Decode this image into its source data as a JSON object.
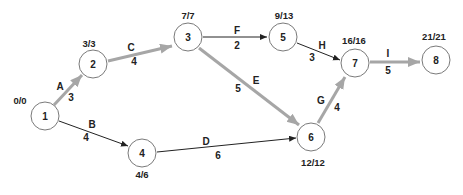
{
  "diagram": {
    "type": "activity-on-arrow network (critical path)",
    "nodes": [
      {
        "id": "1",
        "label": "1",
        "times": "0/0",
        "x": 45,
        "y": 116
      },
      {
        "id": "2",
        "label": "2",
        "times": "3/3",
        "x": 93,
        "y": 64
      },
      {
        "id": "3",
        "label": "3",
        "times": "7/7",
        "x": 188,
        "y": 37
      },
      {
        "id": "4",
        "label": "4",
        "times": "4/6",
        "x": 142,
        "y": 153
      },
      {
        "id": "5",
        "label": "5",
        "times": "9/13",
        "x": 283,
        "y": 37
      },
      {
        "id": "6",
        "label": "6",
        "times": "12/12",
        "x": 311,
        "y": 137
      },
      {
        "id": "7",
        "label": "7",
        "times": "16/16",
        "x": 355,
        "y": 63
      },
      {
        "id": "8",
        "label": "8",
        "times": "21/21",
        "x": 436,
        "y": 60
      }
    ],
    "edges": [
      {
        "activity": "A",
        "duration": "3",
        "from": "1",
        "to": "2",
        "critical": true
      },
      {
        "activity": "B",
        "duration": "4",
        "from": "1",
        "to": "4",
        "critical": false
      },
      {
        "activity": "C",
        "duration": "4",
        "from": "2",
        "to": "3",
        "critical": true
      },
      {
        "activity": "D",
        "duration": "6",
        "from": "4",
        "to": "6",
        "critical": false
      },
      {
        "activity": "E",
        "duration": "5",
        "from": "3",
        "to": "6",
        "critical": true
      },
      {
        "activity": "F",
        "duration": "2",
        "from": "3",
        "to": "5",
        "critical": false
      },
      {
        "activity": "G",
        "duration": "4",
        "from": "6",
        "to": "7",
        "critical": true
      },
      {
        "activity": "H",
        "duration": "3",
        "from": "5",
        "to": "7",
        "critical": false
      },
      {
        "activity": "I",
        "duration": "5",
        "from": "7",
        "to": "8",
        "critical": true
      }
    ],
    "colors": {
      "critical_edge": "#a6a6a6",
      "normal_edge": "#222222",
      "node_stroke": "#7a7a7a"
    }
  }
}
